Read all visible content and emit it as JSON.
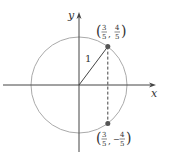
{
  "diagram": {
    "type": "unit-circle",
    "axes": {
      "x_label": "x",
      "y_label": "y"
    },
    "radius_label": "1",
    "points": [
      {
        "name": "upper",
        "x": 0.6,
        "y": 0.8,
        "label_x_num": "3",
        "label_x_den": "5",
        "label_y_sign": "",
        "label_y_num": "4",
        "label_y_den": "5"
      },
      {
        "name": "lower",
        "x": 0.6,
        "y": -0.8,
        "label_x_num": "3",
        "label_x_den": "5",
        "label_y_sign": "−",
        "label_y_num": "4",
        "label_y_den": "5"
      }
    ],
    "colors": {
      "circle": "#aaaaaa",
      "axes": "#444444",
      "line": "#444444",
      "point": "#555555"
    }
  }
}
